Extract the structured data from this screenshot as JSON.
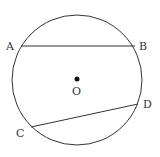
{
  "diagram": {
    "type": "circle-chords",
    "circle": {
      "center": "O",
      "cx": 77,
      "cy": 80,
      "r": 65
    },
    "points": {
      "A": {
        "label": "A",
        "x": 21,
        "y": 46,
        "lx": 6,
        "ly": 50
      },
      "B": {
        "label": "B",
        "x": 135,
        "y": 46,
        "lx": 139,
        "ly": 50
      },
      "C": {
        "label": "C",
        "x": 31,
        "y": 127,
        "lx": 16,
        "ly": 137
      },
      "D": {
        "label": "D",
        "x": 138,
        "y": 104,
        "lx": 143,
        "ly": 108
      },
      "O": {
        "label": "O",
        "x": 77,
        "y": 79,
        "lx": 72,
        "ly": 95
      }
    },
    "chords": [
      {
        "from": "A",
        "to": "B"
      },
      {
        "from": "C",
        "to": "D"
      }
    ],
    "stroke_color": "#333333"
  }
}
